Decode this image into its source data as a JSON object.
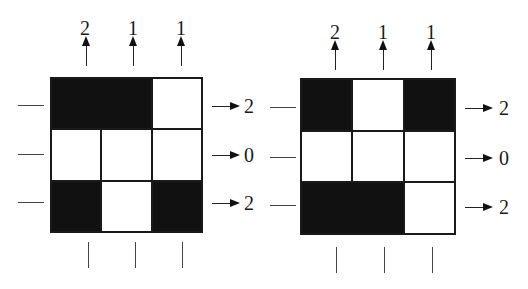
{
  "diagrams": [
    {
      "name": "left-grid",
      "cells": [
        [
          1,
          1,
          0
        ],
        [
          0,
          0,
          0
        ],
        [
          1,
          0,
          1
        ]
      ],
      "column_counts": [
        "2",
        "1",
        "1"
      ],
      "row_counts": [
        "2",
        "0",
        "2"
      ]
    },
    {
      "name": "right-grid",
      "cells": [
        [
          1,
          0,
          1
        ],
        [
          0,
          0,
          0
        ],
        [
          1,
          1,
          0
        ]
      ],
      "column_counts": [
        "2",
        "1",
        "1"
      ],
      "row_counts": [
        "2",
        "0",
        "2"
      ]
    }
  ],
  "colors": {
    "filled": "#111111",
    "empty": "#ffffff",
    "line": "#1a1a1a"
  }
}
